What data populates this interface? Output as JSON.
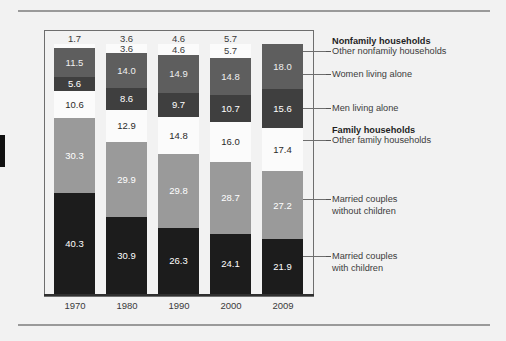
{
  "chart_data": {
    "type": "bar",
    "subtype": "stacked-percentage",
    "title": "",
    "xlabel": "",
    "ylabel": "",
    "ylim": [
      0,
      100
    ],
    "grid": false,
    "legend_position": "right",
    "categories": [
      "1970",
      "1980",
      "1990",
      "2000",
      "2009"
    ],
    "series": [
      {
        "name": "Married couples with children",
        "key": "married_with_children",
        "color": "#1c1c1c",
        "text_color": "#ffffff",
        "values": [
          40.3,
          30.9,
          26.3,
          24.1,
          21.9
        ]
      },
      {
        "name": "Married couples without children",
        "key": "married_without_children",
        "color": "#9a9a9a",
        "text_color": "#ffffff",
        "values": [
          30.3,
          29.9,
          29.8,
          28.7,
          27.2
        ]
      },
      {
        "name": "Other family households",
        "key": "other_family",
        "color": "#fbfbfb",
        "text_color": "#2a2a2a",
        "values": [
          10.6,
          12.9,
          14.8,
          16.0,
          17.4
        ]
      },
      {
        "name": "Men living alone",
        "key": "men_living_alone",
        "color": "#3f3f3f",
        "text_color": "#ffffff",
        "values": [
          5.6,
          8.6,
          9.7,
          10.7,
          15.6
        ]
      },
      {
        "name": "Women living alone",
        "key": "women_living_alone",
        "color": "#5e5e5e",
        "text_color": "#f0f0f0",
        "values": [
          11.5,
          14.0,
          14.9,
          14.8,
          18.0
        ]
      },
      {
        "name": "Other nonfamily households",
        "key": "other_nonfamily",
        "color": "#fbfbfb",
        "text_color": "#3a3a3a",
        "values": [
          1.7,
          3.6,
          4.6,
          5.7,
          null
        ],
        "label_above_bar": true
      }
    ],
    "cap_values": [
      "1.7",
      "3.6",
      "4.6",
      "5.7",
      ""
    ]
  },
  "axis": {
    "x_tick_labels": [
      "1970",
      "1980",
      "1990",
      "2000",
      "2009"
    ]
  },
  "legend": {
    "entries": [
      {
        "label": "Nonfamily households",
        "bold": true,
        "dash": false
      },
      {
        "label": "Other nonfamily households",
        "bold": false,
        "dash": true
      },
      {
        "label": "Women living alone",
        "bold": false,
        "dash": true
      },
      {
        "label": "Men living alone",
        "bold": false,
        "dash": true
      },
      {
        "label": "Family households",
        "bold": true,
        "dash": false
      },
      {
        "label": "Other family households",
        "bold": false,
        "dash": true
      },
      {
        "label": "Married couples\nwithout children",
        "bold": false,
        "dash": true
      },
      {
        "label": "Married couples\nwith children",
        "bold": false,
        "dash": true
      }
    ]
  },
  "values_2009": {
    "other_nonfamily": "18.0",
    "men_living_alone": "15.6",
    "other_family": "17.4",
    "married_without": "27.2",
    "married_with": "21.9"
  }
}
